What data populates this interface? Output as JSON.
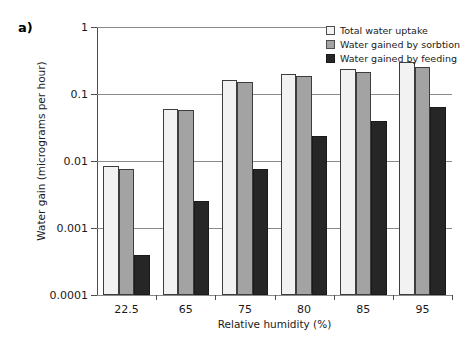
{
  "panel": {
    "label": "a)"
  },
  "chart_data": {
    "type": "bar",
    "title": "",
    "xlabel": "Relative humidity (%)",
    "ylabel": "Water gain (micrograms per hour)",
    "categories": [
      "22.5",
      "65",
      "75",
      "80",
      "85",
      "95"
    ],
    "yscale": "log",
    "ylim": [
      0.0001,
      1
    ],
    "yticks": [
      0.0001,
      0.001,
      0.01,
      0.1,
      1
    ],
    "ytick_labels": [
      "0.0001",
      "0.001",
      "0.01",
      "0.1",
      "1"
    ],
    "grid": true,
    "legend_position": "top-right",
    "series": [
      {
        "name": "Total water uptake",
        "color": "#f2f2f2",
        "values": [
          0.0085,
          0.06,
          0.16,
          0.2,
          0.24,
          0.3
        ]
      },
      {
        "name": "Water gained by sorbtion",
        "color": "#a3a3a3",
        "values": [
          0.0075,
          0.057,
          0.15,
          0.185,
          0.215,
          0.255
        ]
      },
      {
        "name": "Water gained by feeding",
        "color": "#262626",
        "values": [
          0.0004,
          0.0025,
          0.0075,
          0.024,
          0.04,
          0.065
        ]
      }
    ]
  }
}
